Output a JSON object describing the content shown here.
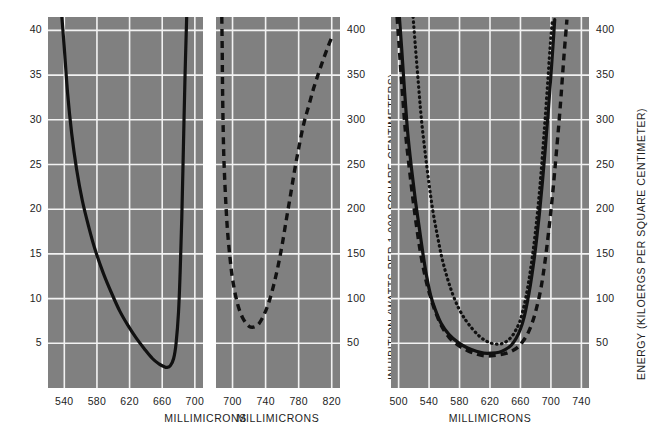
{
  "figure": {
    "background": "#ffffff",
    "plot_background": "#808080",
    "grid_color": "#f2f2f2",
    "ink_color": "#111111"
  },
  "chart_data": [
    {
      "id": "panel-germination",
      "type": "line",
      "title": "",
      "xlabel": "MILLIMICRONS",
      "ylabel": "GERMINATION (WATTS PER 1,000 SQUARE CENTIMETERS)",
      "ylabel_side": "left",
      "xlim": [
        520,
        710
      ],
      "ylim": [
        0,
        41.5
      ],
      "xticks": [
        540,
        580,
        620,
        660,
        700
      ],
      "yticks": [
        5,
        10,
        15,
        20,
        25,
        30,
        35,
        40
      ],
      "grid": true,
      "series": [
        {
          "name": "germination threshold",
          "style": "solid",
          "x": [
            537,
            540,
            544,
            549,
            555,
            562,
            570,
            578,
            588,
            598,
            608,
            618,
            628,
            638,
            648,
            656,
            662,
            666,
            670,
            674,
            677,
            680,
            682,
            684,
            686,
            688,
            690
          ],
          "y": [
            41.5,
            38.0,
            33.0,
            28.5,
            24.5,
            21.0,
            18.0,
            15.4,
            12.8,
            10.6,
            8.6,
            7.0,
            5.6,
            4.4,
            3.3,
            2.7,
            2.4,
            2.3,
            2.5,
            3.3,
            5.0,
            8.5,
            13.0,
            19.0,
            27.0,
            35.0,
            41.5
          ]
        }
      ]
    },
    {
      "id": "panel-inhibition",
      "type": "line",
      "title": "",
      "xlabel": "MILLIMICRONS",
      "ylabel": "INHIBITION (WATTS PER 1,000 SQUARE CENTIMETERS)",
      "ylabel_side": "right",
      "xlim": [
        680,
        830
      ],
      "ylim": [
        0,
        415
      ],
      "xticks": [
        700,
        740,
        780,
        820
      ],
      "yticks": [
        50,
        100,
        150,
        200,
        250,
        300,
        350,
        400
      ],
      "grid": true,
      "series": [
        {
          "name": "inhibition threshold",
          "style": "dashed",
          "x": [
            687,
            687.5,
            688,
            689,
            690,
            692,
            694,
            697,
            700,
            704,
            708,
            712,
            716,
            720,
            724,
            728,
            732,
            736,
            740,
            745,
            750,
            755,
            760,
            765,
            770,
            775,
            780,
            786,
            792,
            798,
            804,
            810,
            816,
            820
          ],
          "y": [
            415,
            380,
            330,
            275,
            245,
            205,
            175,
            145,
            122,
            102,
            88,
            79,
            73,
            69,
            68,
            69,
            72,
            78,
            86,
            99,
            116,
            136,
            160,
            188,
            215,
            243,
            268,
            295,
            315,
            335,
            352,
            368,
            383,
            392
          ]
        }
      ]
    },
    {
      "id": "panel-energy",
      "type": "line",
      "title": "",
      "xlabel": "MILLIMICRONS",
      "ylabel": "ENERGY (KILOERGS PER SQUARE CENTIMETER)",
      "ylabel_side": "right",
      "xlim": [
        490,
        750
      ],
      "ylim": [
        0,
        415
      ],
      "xticks": [
        500,
        540,
        580,
        620,
        660,
        700,
        740
      ],
      "yticks": [
        50,
        100,
        150,
        200,
        250,
        300,
        350,
        400
      ],
      "grid": true,
      "series": [
        {
          "name": "solid curve",
          "style": "solid",
          "x": [
            501,
            504,
            508,
            512,
            517,
            522,
            527,
            532,
            537,
            542,
            548,
            556,
            566,
            578,
            590,
            602,
            612,
            622,
            632,
            640,
            648,
            654,
            660,
            665,
            669,
            673,
            677,
            681,
            685,
            689,
            693,
            697,
            701,
            705
          ],
          "y": [
            415,
            380,
            330,
            285,
            245,
            210,
            180,
            150,
            124,
            104,
            88,
            72,
            60,
            51,
            45,
            41,
            39,
            39,
            40,
            43,
            48,
            55,
            66,
            80,
            96,
            115,
            138,
            165,
            196,
            232,
            272,
            315,
            362,
            412
          ]
        },
        {
          "name": "dashed curve",
          "style": "dashed",
          "x": [
            498,
            501,
            505,
            509,
            514,
            519,
            524,
            529,
            535,
            541,
            548,
            556,
            566,
            578,
            590,
            602,
            612,
            622,
            632,
            642,
            650,
            657,
            663,
            669,
            675,
            681,
            687,
            692,
            697,
            702,
            707,
            712,
            717,
            721
          ],
          "y": [
            415,
            378,
            330,
            286,
            246,
            210,
            178,
            150,
            124,
            104,
            86,
            70,
            57,
            48,
            42,
            38,
            36,
            36,
            37,
            39,
            42,
            46,
            52,
            60,
            72,
            89,
            112,
            140,
            175,
            215,
            262,
            312,
            370,
            412
          ]
        },
        {
          "name": "dotted curve",
          "style": "dotted",
          "x": [
            519,
            522,
            526,
            530,
            535,
            540,
            545,
            551,
            557,
            564,
            571,
            579,
            588,
            597,
            606,
            614,
            622,
            630,
            637,
            643,
            649,
            654,
            659,
            663,
            667,
            671,
            675,
            679,
            683,
            687,
            691,
            695,
            699,
            702
          ],
          "y": [
            415,
            382,
            340,
            300,
            262,
            228,
            198,
            170,
            145,
            123,
            105,
            89,
            76,
            66,
            58,
            53,
            50,
            49,
            50,
            53,
            58,
            65,
            74,
            86,
            101,
            120,
            143,
            170,
            202,
            240,
            285,
            332,
            382,
            412
          ]
        }
      ]
    }
  ],
  "panels": [
    {
      "name": "germination",
      "xlabel": "MILLIMICRONS",
      "ylabel": "GERMINATION (WATTS PER 1,000 SQUARE CENTIMETERS)",
      "xticks": [
        "540",
        "580",
        "620",
        "660",
        "700"
      ],
      "yticks": [
        "40",
        "35",
        "30",
        "25",
        "20",
        "15",
        "10",
        "5"
      ]
    },
    {
      "name": "inhibition",
      "xlabel": "MILLIMICRONS",
      "ylabel": "INHIBITION (WATTS PER 1,000 SQUARE CENTIMETERS)",
      "xticks": [
        "700",
        "740",
        "780",
        "820"
      ],
      "yticks": [
        "400",
        "350",
        "300",
        "250",
        "200",
        "150",
        "100",
        "50"
      ]
    },
    {
      "name": "energy",
      "xlabel": "MILLIMICRONS",
      "ylabel": "ENERGY (KILOERGS PER SQUARE CENTIMETER)",
      "xticks": [
        "500",
        "540",
        "580",
        "620",
        "660",
        "700",
        "740"
      ],
      "yticks": [
        "400",
        "350",
        "300",
        "250",
        "200",
        "150",
        "100",
        "50"
      ]
    }
  ]
}
